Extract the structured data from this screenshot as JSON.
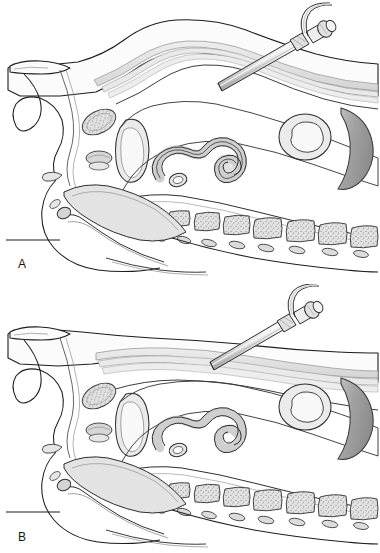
{
  "figure": {
    "type": "medical-line-illustration",
    "background_color": "#ffffff",
    "panels": [
      {
        "id": "A",
        "label": "A",
        "caption_stage": "Veress needle inserted through abdominal wall layers",
        "needle_tip_depth": "deep",
        "peritoneum_state": "apposed to abdominal wall"
      },
      {
        "id": "B",
        "label": "B",
        "caption_stage": "Pneumoperitoneum established, abdominal wall elevated",
        "needle_tip_depth": "shallow",
        "peritoneum_state": "separated from abdominal wall"
      }
    ]
  },
  "colors": {
    "outline": "#1d1d1d",
    "outline_soft": "#5a5a5a",
    "fill_light": "#f2f2f2",
    "fill_mid": "#d8d8d8",
    "fill_muscle": "#e3e3e3",
    "fill_bowel": "#cfcfcf",
    "fill_bowel_lumen": "#efefef",
    "fill_dark_organ": "#9a9a9a",
    "fill_dark_organ_edge": "#b6b6b6",
    "fill_bone": "#dedede",
    "stipple": "#6e6e6e",
    "instrument_metal": "#e8e8e8",
    "instrument_shadow": "#a8a8a8",
    "skin_line": "#2a2a2a",
    "table_line": "#1d1d1d"
  },
  "anatomy": {
    "structures": [
      {
        "name": "anterior-abdominal-wall",
        "label": "Anterior abdominal wall"
      },
      {
        "name": "rectus-abdominis-muscle",
        "label": "Rectus abdominis muscle"
      },
      {
        "name": "peritoneum",
        "label": "Peritoneum"
      },
      {
        "name": "umbilicus",
        "label": "Umbilicus"
      },
      {
        "name": "sternum-cross-section",
        "label": "Sternum / xiphoid (stippled bone)"
      },
      {
        "name": "small-bowel-loop",
        "label": "Small bowel loop"
      },
      {
        "name": "transverse-colon",
        "label": "Transverse colon cross-section"
      },
      {
        "name": "liver-or-stomach",
        "label": "Crescent solid viscus"
      },
      {
        "name": "vertebral-bodies",
        "label": "Lumbar vertebral bodies"
      },
      {
        "name": "spinous-processes",
        "label": "Spinous processes"
      },
      {
        "name": "bladder",
        "label": "Urinary bladder"
      },
      {
        "name": "pelvic-floor",
        "label": "Pelvic floor structures"
      },
      {
        "name": "symphysis-pubis",
        "label": "Symphysis pubis"
      },
      {
        "name": "operating-table-line",
        "label": "Operating table surface line"
      }
    ]
  },
  "instrument": {
    "name": "veress-needle",
    "label": "Veress insufflation needle",
    "parts": [
      {
        "name": "needle-shaft",
        "label": "Needle shaft"
      },
      {
        "name": "luer-lock-hub",
        "label": "Luer-lock hub"
      },
      {
        "name": "stopcock-valve",
        "label": "Stopcock valve"
      },
      {
        "name": "insufflation-tubing",
        "label": "Insufflation tubing"
      }
    ],
    "angle_degrees": 45
  },
  "vertebrae": {
    "count": 7,
    "texture": "stippled trabecular bone"
  }
}
